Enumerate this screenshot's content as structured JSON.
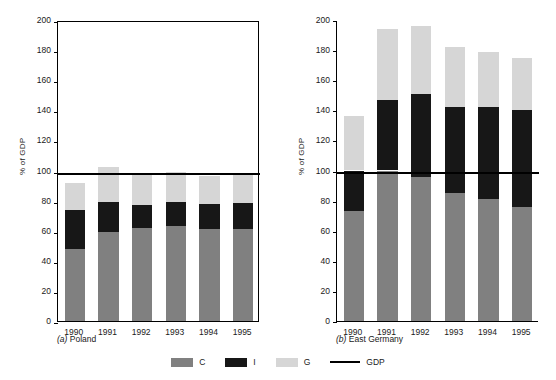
{
  "chart_data": [
    {
      "type": "bar",
      "stacked": true,
      "title": "(a) Poland",
      "panel_letter": "a",
      "panel_name": "Poland",
      "xlabel": "",
      "ylabel": "% of GDP",
      "ylim": [
        0,
        200
      ],
      "yticks": [
        0,
        20,
        40,
        60,
        80,
        100,
        120,
        140,
        160,
        180,
        200
      ],
      "grid": false,
      "framed": true,
      "categories": [
        "1990",
        "1991",
        "1992",
        "1993",
        "1994",
        "1995"
      ],
      "series": [
        {
          "name": "C",
          "color": "#808080",
          "values": [
            48,
            59,
            61.5,
            63,
            61,
            61
          ]
        },
        {
          "name": "I",
          "color": "#171717",
          "values": [
            26,
            20,
            15.5,
            16,
            17,
            17.5
          ]
        },
        {
          "name": "G",
          "color": "#d6d6d6",
          "values": [
            18,
            23,
            21,
            20,
            18.5,
            20
          ]
        }
      ],
      "totals": [
        92,
        102,
        98,
        99,
        96.5,
        98.5
      ],
      "reference_line": {
        "name": "GDP",
        "value": 100,
        "color": "#000000"
      }
    },
    {
      "type": "bar",
      "stacked": true,
      "title": "(b) East Germany",
      "panel_letter": "b",
      "panel_name": "East Germany",
      "xlabel": "",
      "ylabel": "% of GDP",
      "ylim": [
        0,
        200
      ],
      "yticks": [
        0,
        20,
        40,
        60,
        80,
        100,
        120,
        140,
        160,
        180,
        200
      ],
      "grid": false,
      "framed": false,
      "categories": [
        "1990",
        "1991",
        "1992",
        "1993",
        "1994",
        "1995"
      ],
      "series": [
        {
          "name": "C",
          "color": "#808080",
          "values": [
            73,
            100,
            96,
            85,
            81,
            76
          ]
        },
        {
          "name": "I",
          "color": "#171717",
          "values": [
            27,
            47,
            55,
            57.5,
            61.5,
            64
          ]
        },
        {
          "name": "G",
          "color": "#d6d6d6",
          "values": [
            36,
            47,
            45,
            39.5,
            36.5,
            35
          ]
        }
      ],
      "totals": [
        136,
        194,
        196,
        182,
        179,
        175
      ],
      "reference_line": {
        "name": "GDP",
        "value": 100,
        "color": "#000000"
      }
    }
  ],
  "legend": {
    "position": "bottom-center",
    "items": [
      {
        "label": "C",
        "type": "swatch",
        "color": "#808080"
      },
      {
        "label": "I",
        "type": "swatch",
        "color": "#171717"
      },
      {
        "label": "G",
        "type": "swatch",
        "color": "#d6d6d6"
      },
      {
        "label": "GDP",
        "type": "line",
        "color": "#000000"
      }
    ]
  }
}
